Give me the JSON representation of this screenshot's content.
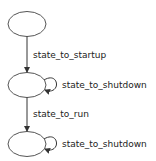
{
  "diagram": {
    "type": "state-machine",
    "colors": {
      "stroke": "#555555",
      "text": "#222222",
      "background": "#ffffff"
    },
    "nodes": [
      {
        "id": "n0",
        "label": ""
      },
      {
        "id": "n1",
        "label": ""
      },
      {
        "id": "n2",
        "label": ""
      }
    ],
    "edges": [
      {
        "from": "n0",
        "to": "n1",
        "label": "state_to_startup"
      },
      {
        "from": "n1",
        "to": "n1",
        "label": "state_to_shutdown"
      },
      {
        "from": "n1",
        "to": "n2",
        "label": "state_to_run"
      },
      {
        "from": "n2",
        "to": "n2",
        "label": "state_to_shutdown"
      }
    ]
  }
}
